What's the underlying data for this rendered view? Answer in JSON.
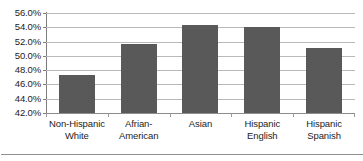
{
  "chart_data": {
    "type": "bar",
    "title": "",
    "subtitle": "",
    "xlabel": "",
    "ylabel": "",
    "categories": [
      "Non-Hispanic\nWhite",
      "Afrian-\nAmerican",
      "Asian",
      "Hispanic\nEnglish",
      "Hispanic\nSpanish"
    ],
    "values": [
      47.3,
      51.6,
      54.3,
      54.1,
      51.1
    ],
    "value_labels": [
      "47.3%",
      "51.6%",
      "54.3%",
      "54.1%",
      "51.1%"
    ],
    "ylim": [
      42.0,
      56.0
    ],
    "ytick_values": [
      42.0,
      44.0,
      46.0,
      48.0,
      50.0,
      52.0,
      54.0,
      56.0
    ],
    "ytick_labels": [
      "56.0%",
      "54.0%",
      "52.0%",
      "50.0%",
      "48.0%",
      "46.0%",
      "44.0%",
      "42.0%"
    ],
    "grid": true,
    "grid_axis": "y",
    "legend": false,
    "legend_position": "none",
    "series": [
      {
        "name": "",
        "values": [
          47.3,
          51.6,
          54.3,
          54.1,
          51.1
        ]
      }
    ]
  },
  "colors": {
    "bar": "#595959",
    "gridline": "#b9b9b9",
    "axis": "#8d8d8d",
    "text": "#1d1d1d",
    "background": "#ffffff",
    "frame": "#8e8e8e"
  }
}
